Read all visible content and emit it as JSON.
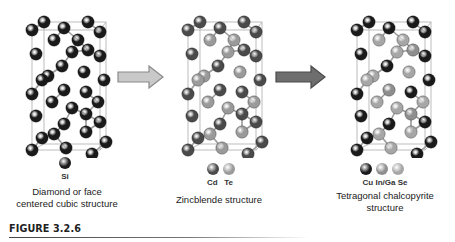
{
  "figure": {
    "label": "FIGURE 3.2.6"
  },
  "colors": {
    "dark": "#1a1a1a",
    "medium": "#4a4a4a",
    "light": "#8e8e8e",
    "lighter": "#a6a6a6",
    "bond": "#9a9a9a",
    "cell": "#b5b5b5",
    "arrow_light_fill": "#c9c9c9",
    "arrow_light_stroke": "#8a8a8a",
    "arrow_dark_fill": "#6e6e6e",
    "arrow_dark_stroke": "#4a4a4a"
  },
  "panels": [
    {
      "id": "diamond",
      "symbols_text": "Si",
      "caption_lines": [
        "Diamond or face",
        "centered cubic structure"
      ],
      "legend": [
        {
          "element": "Si",
          "color": "#1a1a1a"
        }
      ],
      "site_colors": {
        "A": "#1a1a1a",
        "B": "#1a1a1a",
        "C": "#1a1a1a"
      }
    },
    {
      "id": "zincblende",
      "symbols_text": "Cd   Te",
      "caption_lines": [
        "Zincblende structure"
      ],
      "legend": [
        {
          "element": "Cd",
          "color": "#4a4a4a"
        },
        {
          "element": "Te",
          "color": "#9a9a9a"
        }
      ],
      "site_colors": {
        "A": "#4a4a4a",
        "B": "#9a9a9a",
        "C": "#4a4a4a"
      }
    },
    {
      "id": "chalcopyrite",
      "symbols_text": "Cu In/Ga Se",
      "caption_lines": [
        "Tetragonal chalcopyrite",
        "structure"
      ],
      "legend": [
        {
          "element": "Cu",
          "color": "#1a1a1a"
        },
        {
          "element": "In/Ga",
          "color": "#8e8e8e"
        },
        {
          "element": "Se",
          "color": "#a6a6a6"
        }
      ],
      "site_colors": {
        "A": "#1a1a1a",
        "B": "#a6a6a6",
        "C": "#8e8e8e"
      }
    }
  ],
  "arrows": [
    {
      "id": "arrow-1",
      "style": "light"
    },
    {
      "id": "arrow-2",
      "style": "dark"
    }
  ],
  "lattice_sites": [
    {
      "x": 16,
      "y": 4,
      "s": "A"
    },
    {
      "x": 60,
      "y": 4,
      "s": "A"
    },
    {
      "x": 4,
      "y": 12,
      "s": "A"
    },
    {
      "x": 36,
      "y": 10,
      "s": "A"
    },
    {
      "x": 72,
      "y": 14,
      "s": "A"
    },
    {
      "x": 26,
      "y": 22,
      "s": "B"
    },
    {
      "x": 50,
      "y": 22,
      "s": "B"
    },
    {
      "x": 60,
      "y": 32,
      "s": "C"
    },
    {
      "x": 44,
      "y": 34,
      "s": "B"
    },
    {
      "x": 8,
      "y": 36,
      "s": "A"
    },
    {
      "x": 72,
      "y": 38,
      "s": "A"
    },
    {
      "x": 34,
      "y": 48,
      "s": "A"
    },
    {
      "x": 56,
      "y": 54,
      "s": "B"
    },
    {
      "x": 20,
      "y": 58,
      "s": "B"
    },
    {
      "x": 14,
      "y": 62,
      "s": "B"
    },
    {
      "x": 76,
      "y": 62,
      "s": "A"
    },
    {
      "x": 36,
      "y": 72,
      "s": "C"
    },
    {
      "x": 4,
      "y": 76,
      "s": "A"
    },
    {
      "x": 58,
      "y": 74,
      "s": "A"
    },
    {
      "x": 24,
      "y": 84,
      "s": "B"
    },
    {
      "x": 44,
      "y": 90,
      "s": "B"
    },
    {
      "x": 70,
      "y": 84,
      "s": "B"
    },
    {
      "x": 8,
      "y": 98,
      "s": "A"
    },
    {
      "x": 58,
      "y": 96,
      "s": "C"
    },
    {
      "x": 36,
      "y": 106,
      "s": "A"
    },
    {
      "x": 72,
      "y": 104,
      "s": "A"
    },
    {
      "x": 26,
      "y": 116,
      "s": "B"
    },
    {
      "x": 14,
      "y": 120,
      "s": "A"
    },
    {
      "x": 58,
      "y": 114,
      "s": "B"
    },
    {
      "x": 4,
      "y": 132,
      "s": "A"
    },
    {
      "x": 38,
      "y": 130,
      "s": "B"
    },
    {
      "x": 64,
      "y": 136,
      "s": "A"
    },
    {
      "x": 78,
      "y": 124,
      "s": "A"
    }
  ]
}
